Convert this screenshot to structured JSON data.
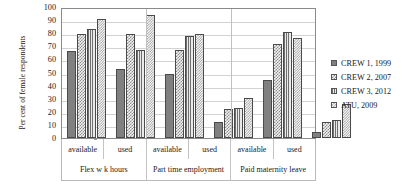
{
  "chart_data": {
    "type": "bar",
    "title": "",
    "xlabel": "",
    "ylabel": "Per cent of female respondents",
    "ylim": [
      0,
      100
    ],
    "ytick_step": 10,
    "yticks": [
      100,
      90,
      80,
      70,
      60,
      50,
      40,
      30,
      20,
      10,
      0
    ],
    "grid": true,
    "legend_position": "right",
    "categories": [
      "available",
      "used",
      "available",
      "used",
      "available",
      "used"
    ],
    "group_labels": [
      "Flex w k hours",
      "Part time employment",
      "Paid maternity leave"
    ],
    "series": [
      {
        "name": "CREW 1, 1999",
        "values": [
          66.5,
          52.5,
          49,
          12.5,
          44.5,
          4.5
        ]
      },
      {
        "name": "CREW 2, 2007",
        "values": [
          79.5,
          79.5,
          67.5,
          22.5,
          72,
          12
        ]
      },
      {
        "name": "CREW 3, 2012",
        "values": [
          83,
          67,
          78,
          23,
          81,
          14
        ]
      },
      {
        "name": "ATU, 2009",
        "values": [
          91,
          94,
          79.5,
          30.5,
          76.5,
          26
        ]
      }
    ]
  },
  "legend": {
    "items": [
      {
        "label": "CREW 1, 1999"
      },
      {
        "label": "CREW 2, 2007"
      },
      {
        "label": "CREW 3, 2012"
      },
      {
        "label": "ATU, 2009"
      }
    ]
  }
}
